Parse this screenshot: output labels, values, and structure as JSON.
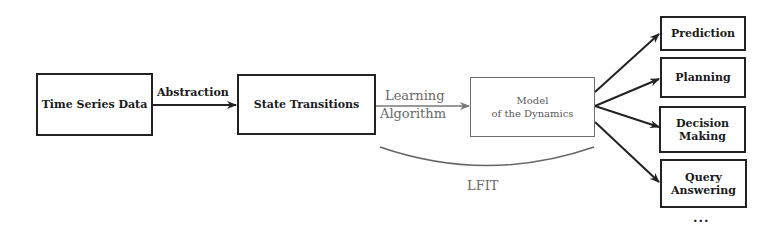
{
  "diagram": {
    "nodes": {
      "time_series": "Time Series Data",
      "state_transitions": "State Transitions",
      "model_line1": "Model",
      "model_line2": "of the Dynamics"
    },
    "edges": {
      "abstraction": "Abstraction",
      "learning_line1": "Learning",
      "learning_line2": "Algorithm"
    },
    "bracket_label": "LFIT",
    "applications": [
      {
        "line1": "Prediction",
        "line2": ""
      },
      {
        "line1": "Planning",
        "line2": ""
      },
      {
        "line1": "Decision",
        "line2": "Making"
      },
      {
        "line1": "Query",
        "line2": "Answering"
      }
    ],
    "more": "...",
    "colors": {
      "primary_stroke": "#222222",
      "secondary_stroke": "#6e6e6e"
    }
  }
}
